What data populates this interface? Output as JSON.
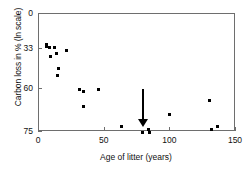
{
  "chart_data": {
    "type": "scatter",
    "title": "",
    "xlabel": "Age of litter (years)",
    "ylabel": "Carbon loss in % (ln scale)",
    "xlim": [
      0,
      150
    ],
    "ylim": [
      0,
      75
    ],
    "y_axis_inverted": true,
    "y_scale_note": "ln scale",
    "grid": false,
    "legend": null,
    "xticks": [
      0,
      50,
      100,
      150
    ],
    "yticks": [
      0,
      33,
      60,
      75
    ],
    "xtick_labels": [
      "0",
      "50",
      "100",
      "150"
    ],
    "ytick_labels": [
      "0",
      "33",
      "60",
      "75"
    ],
    "points": [
      {
        "x": 6,
        "y": 29
      },
      {
        "x": 6,
        "y": 31
      },
      {
        "x": 8,
        "y": 32
      },
      {
        "x": 9,
        "y": 38
      },
      {
        "x": 12,
        "y": 32
      },
      {
        "x": 13,
        "y": 36
      },
      {
        "x": 14,
        "y": 51
      },
      {
        "x": 15,
        "y": 46
      },
      {
        "x": 21,
        "y": 34
      },
      {
        "x": 31,
        "y": 60
      },
      {
        "x": 34,
        "y": 61
      },
      {
        "x": 34,
        "y": 66
      },
      {
        "x": 45,
        "y": 60
      },
      {
        "x": 63,
        "y": 73
      },
      {
        "x": 79,
        "y": 75
      },
      {
        "x": 83,
        "y": 74
      },
      {
        "x": 84,
        "y": 75
      },
      {
        "x": 99,
        "y": 69
      },
      {
        "x": 130,
        "y": 64
      },
      {
        "x": 131,
        "y": 74
      },
      {
        "x": 136,
        "y": 73
      }
    ],
    "annotations": [
      {
        "type": "arrow",
        "direction": "down",
        "x": 79,
        "y_tail": 60,
        "y_head": 73,
        "color": "#000000"
      }
    ],
    "marker": {
      "shape": "square",
      "color": "#000000",
      "size_px": 3
    },
    "axes_color": "#6e6e6e"
  }
}
